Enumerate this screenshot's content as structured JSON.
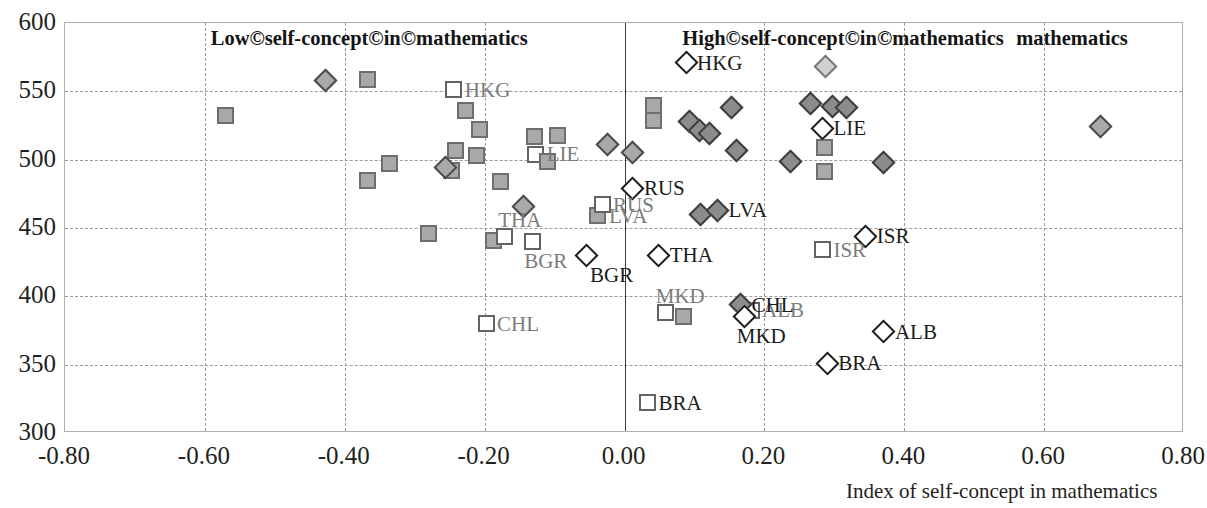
{
  "chart_data": {
    "type": "scatter",
    "title": "",
    "xlabel": "Index of self-concept in mathematics",
    "ylabel": "",
    "xlim": [
      -0.8,
      0.8
    ],
    "ylim": [
      300,
      600
    ],
    "xticks": [
      "-0.80",
      "-0.60",
      "-0.40",
      "-0.20",
      "0.00",
      "0.20",
      "0.40",
      "0.60",
      "0.80"
    ],
    "xtick_values": [
      -0.8,
      -0.6,
      -0.4,
      -0.2,
      0.0,
      0.2,
      0.4,
      0.6,
      0.8
    ],
    "yticks": [
      "600",
      "550",
      "500",
      "450",
      "400",
      "350",
      "300"
    ],
    "ytick_values": [
      600,
      550,
      500,
      450,
      400,
      350,
      300
    ],
    "grid": "dashed-both",
    "legend": "none",
    "zero_line_x": 0.0,
    "annotations": [
      {
        "text": "Low©self-concept©in©mathematics",
        "x": -0.37,
        "y": 588
      },
      {
        "text": "High©self-concept©in©mathematics",
        "x": 0.29,
        "y": 588
      },
      {
        "text": "mathematics",
        "x": 0.54,
        "y": 588
      }
    ],
    "series": [
      {
        "name": "squares",
        "marker": "square",
        "points": [
          {
            "x": -0.571,
            "y": 532,
            "fill": "mid",
            "label": ""
          },
          {
            "x": -0.367,
            "y": 559,
            "fill": "mid",
            "label": ""
          },
          {
            "x": -0.244,
            "y": 551,
            "fill": "white",
            "label": "HKG",
            "label_color": "grey",
            "label_pos": "right"
          },
          {
            "x": -0.227,
            "y": 536,
            "fill": "mid",
            "label": ""
          },
          {
            "x": -0.207,
            "y": 522,
            "fill": "mid",
            "label": ""
          },
          {
            "x": -0.242,
            "y": 507,
            "fill": "mid",
            "label": ""
          },
          {
            "x": -0.212,
            "y": 503,
            "fill": "mid",
            "label": ""
          },
          {
            "x": -0.129,
            "y": 517,
            "fill": "mid",
            "label": ""
          },
          {
            "x": -0.096,
            "y": 518,
            "fill": "mid",
            "label": ""
          },
          {
            "x": -0.127,
            "y": 504,
            "fill": "white",
            "label": "LIE",
            "label_color": "grey",
            "label_pos": "left"
          },
          {
            "x": -0.11,
            "y": 499,
            "fill": "mid",
            "label": ""
          },
          {
            "x": -0.367,
            "y": 485,
            "fill": "mid",
            "label": ""
          },
          {
            "x": -0.336,
            "y": 497,
            "fill": "mid",
            "label": ""
          },
          {
            "x": -0.248,
            "y": 492,
            "fill": "mid",
            "label": ""
          },
          {
            "x": -0.177,
            "y": 484,
            "fill": "mid",
            "label": ""
          },
          {
            "x": -0.28,
            "y": 446,
            "fill": "mid",
            "label": ""
          },
          {
            "x": -0.188,
            "y": 441,
            "fill": "mid",
            "label": ""
          },
          {
            "x": -0.172,
            "y": 444,
            "fill": "white",
            "label": "THA",
            "label_color": "grey",
            "label_pos": "above-left"
          },
          {
            "x": -0.132,
            "y": 440,
            "fill": "white",
            "label": "BGR",
            "label_color": "grey",
            "label_pos": "below-left"
          },
          {
            "x": -0.038,
            "y": 459,
            "fill": "mid",
            "label": "LVA",
            "label_color": "grey",
            "label_pos": "right"
          },
          {
            "x": -0.032,
            "y": 467,
            "fill": "white",
            "label": "RUS",
            "label_color": "grey",
            "label_pos": "left"
          },
          {
            "x": -0.198,
            "y": 380,
            "fill": "white",
            "label": "CHL",
            "label_color": "grey",
            "label_pos": "right"
          },
          {
            "x": 0.041,
            "y": 540,
            "fill": "mid",
            "label": ""
          },
          {
            "x": 0.041,
            "y": 529,
            "fill": "mid",
            "label": ""
          },
          {
            "x": 0.286,
            "y": 509,
            "fill": "mid",
            "label": ""
          },
          {
            "x": 0.286,
            "y": 491,
            "fill": "mid",
            "label": ""
          },
          {
            "x": 0.059,
            "y": 388,
            "fill": "white",
            "label": "MKD",
            "label_color": "grey",
            "label_pos": "above"
          },
          {
            "x": 0.085,
            "y": 385,
            "fill": "mid",
            "label": ""
          },
          {
            "x": 0.181,
            "y": 390,
            "fill": "white",
            "label": "ALB",
            "label_color": "grey",
            "label_pos": "right"
          },
          {
            "x": 0.283,
            "y": 434,
            "fill": "white",
            "label": "ISR",
            "label_color": "grey",
            "label_pos": "right"
          },
          {
            "x": 0.033,
            "y": 322,
            "fill": "white",
            "label": "BRA",
            "label_color": "dark",
            "label_pos": "right"
          }
        ]
      },
      {
        "name": "diamonds",
        "marker": "diamond",
        "points": [
          {
            "x": -0.428,
            "y": 558,
            "fill": "mid",
            "label": ""
          },
          {
            "x": -0.256,
            "y": 494,
            "fill": "mid",
            "label": ""
          },
          {
            "x": -0.145,
            "y": 466,
            "fill": "mid",
            "label": ""
          },
          {
            "x": -0.024,
            "y": 511,
            "fill": "mid",
            "label": ""
          },
          {
            "x": 0.012,
            "y": 505,
            "fill": "mid",
            "label": ""
          },
          {
            "x": -0.055,
            "y": 430,
            "fill": "white",
            "label": "BGR",
            "label_color": "dark",
            "label_pos": "below-right"
          },
          {
            "x": 0.012,
            "y": 479,
            "fill": "white",
            "label": "RUS",
            "label_color": "dark",
            "label_pos": "right"
          },
          {
            "x": 0.088,
            "y": 571,
            "fill": "white",
            "label": "HKG",
            "label_color": "dark",
            "label_pos": "right"
          },
          {
            "x": 0.288,
            "y": 568,
            "fill": "light",
            "label": ""
          },
          {
            "x": 0.093,
            "y": 528,
            "fill": "dark",
            "label": ""
          },
          {
            "x": 0.107,
            "y": 521,
            "fill": "dark",
            "label": ""
          },
          {
            "x": 0.121,
            "y": 519,
            "fill": "dark",
            "label": ""
          },
          {
            "x": 0.153,
            "y": 538,
            "fill": "dark",
            "label": ""
          },
          {
            "x": 0.16,
            "y": 507,
            "fill": "dark",
            "label": ""
          },
          {
            "x": 0.266,
            "y": 541,
            "fill": "dark",
            "label": ""
          },
          {
            "x": 0.297,
            "y": 539,
            "fill": "dark",
            "label": ""
          },
          {
            "x": 0.318,
            "y": 538,
            "fill": "dark",
            "label": ""
          },
          {
            "x": 0.283,
            "y": 523,
            "fill": "white",
            "label": "LIE",
            "label_color": "dark",
            "label_pos": "right"
          },
          {
            "x": 0.237,
            "y": 499,
            "fill": "dark",
            "label": ""
          },
          {
            "x": 0.37,
            "y": 498,
            "fill": "dark",
            "label": ""
          },
          {
            "x": 0.108,
            "y": 460,
            "fill": "dark",
            "label": ""
          },
          {
            "x": 0.133,
            "y": 463,
            "fill": "dark",
            "label": "LVA",
            "label_color": "dark",
            "label_pos": "right"
          },
          {
            "x": 0.049,
            "y": 430,
            "fill": "white",
            "label": "THA",
            "label_color": "dark",
            "label_pos": "right"
          },
          {
            "x": 0.345,
            "y": 444,
            "fill": "white",
            "label": "ISR",
            "label_color": "dark",
            "label_pos": "right"
          },
          {
            "x": 0.166,
            "y": 394,
            "fill": "dark",
            "label": "CHL",
            "label_color": "dark",
            "label_pos": "right"
          },
          {
            "x": 0.172,
            "y": 385,
            "fill": "white",
            "label": "MKD",
            "label_color": "dark",
            "label_pos": "below-left"
          },
          {
            "x": 0.371,
            "y": 374,
            "fill": "white",
            "label": "ALB",
            "label_color": "dark",
            "label_pos": "right"
          },
          {
            "x": 0.29,
            "y": 351,
            "fill": "white",
            "label": "BRA",
            "label_color": "dark",
            "label_pos": "right"
          },
          {
            "x": 0.68,
            "y": 524,
            "fill": "mid",
            "label": ""
          }
        ]
      }
    ]
  },
  "colors": {
    "marker_mid": "#a9a9a9",
    "marker_dark": "#8c8c8c",
    "marker_light": "#cfcfcf",
    "grid": "#9a9a9a",
    "axis": "#3a3a3a",
    "text": "#231f20",
    "label_grey": "#7b7b7b"
  }
}
